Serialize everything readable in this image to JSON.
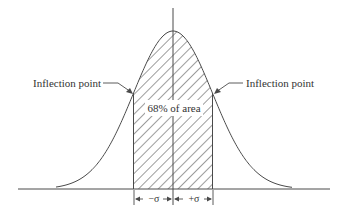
{
  "diagram": {
    "labels": {
      "inflection_left": "Inflection point",
      "inflection_right": "Inflection point",
      "area": "68% of area",
      "minus_sigma": "−σ",
      "plus_sigma": "+σ"
    },
    "colors": {
      "line": "#4a4a4a",
      "text": "#333333",
      "background": "#ffffff"
    },
    "geometry": {
      "mean_x": 173,
      "baseline_y": 189,
      "peak_y": 31,
      "sigma_px": 39.5,
      "shaded_from_sigma": -1,
      "shaded_to_sigma": 1
    }
  }
}
